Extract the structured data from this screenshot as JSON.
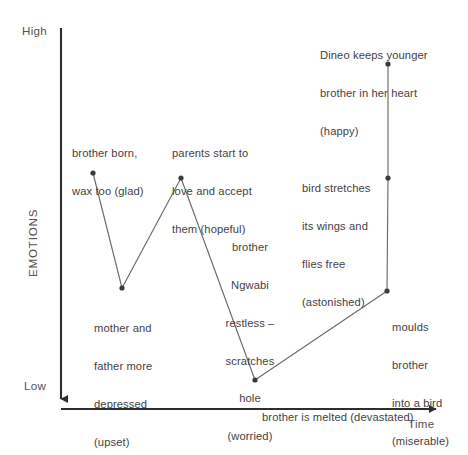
{
  "chart_data": {
    "type": "line",
    "title": "",
    "xlabel": "Time",
    "ylabel": "EMOTIONS",
    "y_axis_high_label": "High",
    "y_axis_low_label": "Low",
    "grid": false,
    "legend": "none",
    "x": [
      1,
      2,
      3,
      4,
      5,
      6,
      7
    ],
    "categories": [
      "brother born, wax too (glad)",
      "mother and father more depressed (upset)",
      "parents start to love and accept them (hopeful)",
      "brother is melted (devastated)",
      "moulds brother into a bird (miserable)",
      "bird stretches its wings and flies free (astonished)",
      "Dineo keeps younger brother in her heart (happy)"
    ],
    "values": [
      68,
      37,
      66,
      7,
      30,
      60,
      90
    ],
    "ylim": [
      0,
      100
    ],
    "points": [
      {
        "label": "glad",
        "emotion": "glad",
        "x": 93,
        "y": 173,
        "value": 68
      },
      {
        "label": "upset",
        "emotion": "upset",
        "x": 122,
        "y": 288,
        "value": 37
      },
      {
        "label": "hopeful",
        "emotion": "hopeful",
        "x": 181,
        "y": 178,
        "value": 66
      },
      {
        "label": "devastated",
        "emotion": "devastated",
        "x": 255,
        "y": 380,
        "value": 7
      },
      {
        "label": "miserable",
        "emotion": "miserable",
        "x": 387,
        "y": 291,
        "value": 30
      },
      {
        "label": "astonished",
        "emotion": "astonished",
        "x": 388,
        "y": 178,
        "value": 60
      },
      {
        "label": "happy",
        "emotion": "happy",
        "x": 388,
        "y": 64,
        "value": 90
      }
    ]
  },
  "axes": {
    "y_high": "High",
    "y_low": "Low",
    "y_title": "EMOTIONS",
    "x_title": "Time"
  },
  "annotations": {
    "glad": {
      "line1": "brother born,",
      "line2": "wax too (glad)"
    },
    "hopeful": {
      "line1": "parents start to",
      "line2": "love and accept",
      "line3": "them (hopeful)"
    },
    "happy": {
      "line1": "Dineo keeps younger",
      "line2": "brother in her heart",
      "line3": "(happy)"
    },
    "astonished": {
      "line1": "bird stretches",
      "line2": "its wings and",
      "line3": "flies free",
      "line4": "(astonished)"
    },
    "worried": {
      "line1": "brother",
      "line2": "Ngwabi",
      "line3": "restless –",
      "line4": "scratches",
      "line5": "hole",
      "line6": "(worried)"
    },
    "upset": {
      "line1": "mother and",
      "line2": "father more",
      "line3": "depressed",
      "line4": "(upset)"
    },
    "miserable": {
      "line1": "moulds",
      "line2": "brother",
      "line3": "into a bird",
      "line4": "(miserable)"
    },
    "devastated": {
      "line1": "brother is melted (devastated)"
    }
  },
  "colors": {
    "ink": "#3b3b3b",
    "line": "#6b6b6b",
    "axis": "#2e2e2e",
    "background": "#ffffff"
  }
}
